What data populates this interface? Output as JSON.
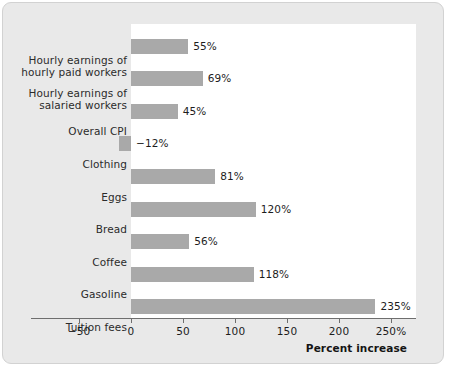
{
  "chart_data": {
    "type": "bar",
    "orientation": "horizontal",
    "title": "",
    "xlabel": "Percent increase",
    "ylabel": "",
    "xlim": [
      -50,
      250
    ],
    "grid": false,
    "legend": null,
    "bar_color": "#a9a9a9",
    "plot_background": "#ffffff",
    "figure_background": "#e9e9e9",
    "tick_labels": [
      "−50",
      "0",
      "50",
      "100",
      "150",
      "200",
      "250%"
    ],
    "tick_values": [
      -50,
      0,
      50,
      100,
      150,
      200,
      250
    ],
    "categories": [
      "Hourly earnings of\nhourly paid workers",
      "Hourly earnings of\nsalaried workers",
      "Overall CPI",
      "Clothing",
      "Eggs",
      "Bread",
      "Coffee",
      "Gasoline",
      "Tuition fees"
    ],
    "values": [
      55,
      69,
      45,
      -12,
      81,
      120,
      56,
      118,
      235
    ],
    "value_labels": [
      "55%",
      "69%",
      "45%",
      "−12%",
      "81%",
      "120%",
      "56%",
      "118%",
      "235%"
    ],
    "bars": [
      {
        "category_line1": "Hourly earnings of",
        "category_line2": "hourly paid workers",
        "value": 55,
        "value_label": "55%"
      },
      {
        "category_line1": "Hourly earnings of",
        "category_line2": "salaried workers",
        "value": 69,
        "value_label": "69%"
      },
      {
        "category_line1": "Overall CPI",
        "category_line2": "",
        "value": 45,
        "value_label": "45%"
      },
      {
        "category_line1": "Clothing",
        "category_line2": "",
        "value": -12,
        "value_label": "−12%"
      },
      {
        "category_line1": "Eggs",
        "category_line2": "",
        "value": 81,
        "value_label": "81%"
      },
      {
        "category_line1": "Bread",
        "category_line2": "",
        "value": 120,
        "value_label": "120%"
      },
      {
        "category_line1": "Coffee",
        "category_line2": "",
        "value": 56,
        "value_label": "56%"
      },
      {
        "category_line1": "Gasoline",
        "category_line2": "",
        "value": 118,
        "value_label": "118%"
      },
      {
        "category_line1": "Tuition fees",
        "category_line2": "",
        "value": 235,
        "value_label": "235%"
      }
    ]
  }
}
